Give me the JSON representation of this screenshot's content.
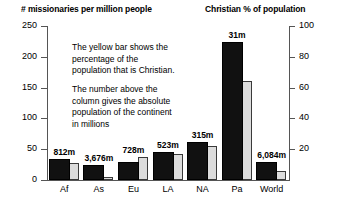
{
  "chart_data": {
    "type": "bar",
    "title": "",
    "left_axis": {
      "label": "# missionaries per million people",
      "ticks": [
        0,
        50,
        100,
        150,
        200,
        250
      ],
      "ylim": [
        0,
        250
      ]
    },
    "right_axis": {
      "label": "Christian % of population",
      "ticks": [
        20,
        40,
        60,
        80,
        100
      ],
      "ylim": [
        0,
        100
      ]
    },
    "categories": [
      "Af",
      "As",
      "Eu",
      "LA",
      "NA",
      "Pa",
      "World"
    ],
    "series": [
      {
        "name": "# missionaries per million people",
        "axis": "left",
        "color": "#111111",
        "values": [
          34,
          24,
          29,
          45,
          62,
          224,
          29
        ]
      },
      {
        "name": "Christian % of population",
        "axis": "right",
        "color": "#dcdcdc",
        "values": [
          11,
          2,
          15,
          17,
          22,
          64,
          6
        ]
      }
    ],
    "point_labels": [
      "812m",
      "3,676m",
      "728m",
      "523m",
      "315m",
      "31m",
      "6,084m"
    ],
    "annotations": [
      "The yellow bar shows the\npercentage of the\npopulation that is Christian.",
      "The number above the\ncolumn gives the absolute\npopulation of the continent\nin millions"
    ],
    "grid": false,
    "legend_position": "none"
  }
}
